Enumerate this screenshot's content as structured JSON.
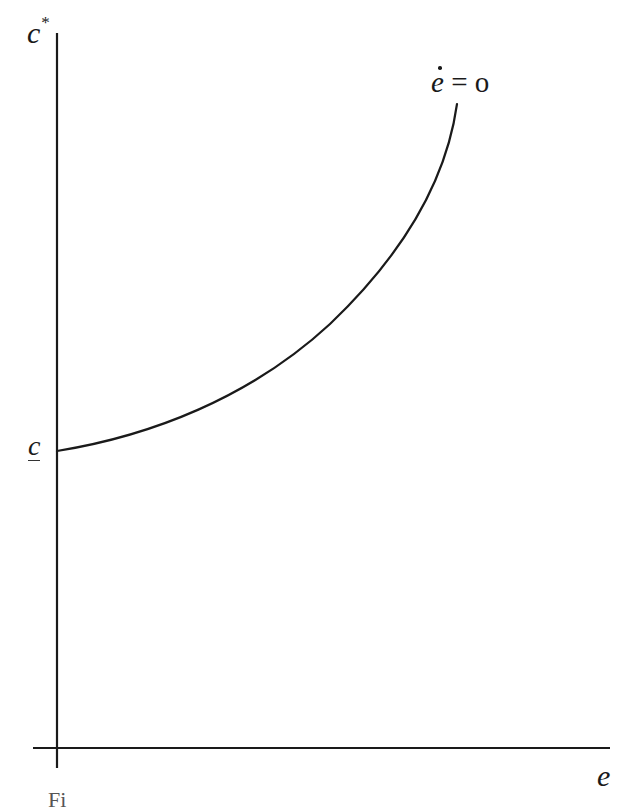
{
  "figure": {
    "y_axis_label": "c",
    "y_axis_label_superscript": "*",
    "x_axis_label": "e",
    "y_intercept_label": "c",
    "y_intercept_label_style": "underlined",
    "curve_label_var": "e",
    "curve_label_rest": " = o",
    "curve_label_full": "ė = o",
    "caption_fragment": "Fi"
  },
  "colors": {
    "ink": "#1a1a1a",
    "background": "#ffffff"
  },
  "geometry": {
    "y_axis": {
      "x": 57,
      "y_top": 33,
      "y_bottom": 768
    },
    "x_axis": {
      "y": 748,
      "x_left": 33,
      "x_right": 610
    },
    "curve": {
      "start": [
        57,
        451
      ],
      "points": [
        [
          57,
          451
        ],
        [
          120,
          438
        ],
        [
          200,
          409
        ],
        [
          310,
          340
        ],
        [
          400,
          240
        ],
        [
          440,
          170
        ],
        [
          457,
          104
        ]
      ]
    }
  }
}
